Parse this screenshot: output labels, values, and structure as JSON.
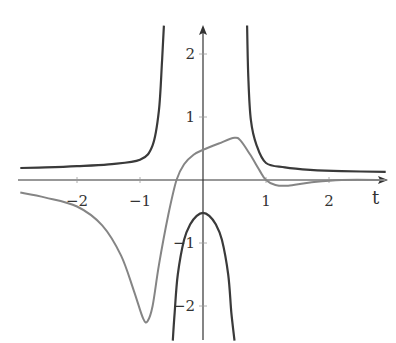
{
  "chart_data": {
    "type": "line",
    "title": "",
    "xlabel": "t",
    "ylabel": "",
    "xlim": [
      -2.9,
      2.9
    ],
    "ylim": [
      -2.55,
      2.45
    ],
    "grid": false,
    "legend": null,
    "x_ticks": [
      -2,
      -1,
      1,
      2
    ],
    "x_tick_labels": [
      "−2",
      "−1",
      "1",
      "2"
    ],
    "y_ticks": [
      2,
      1,
      -1,
      -2
    ],
    "y_tick_labels": [
      "2",
      "1",
      "−1",
      "−2"
    ],
    "colors": {
      "axis": "#333333",
      "dark_curve": "#3a3a3a",
      "gray_curve": "#858585"
    },
    "series": [
      {
        "name": "dark curve (branches with vertical asymptotes near t = ±0.55)",
        "color": "#3a3a3a",
        "segments": [
          {
            "x": [
              -2.9,
              -2.5,
              -2.0,
              -1.5,
              -1.0,
              -0.8,
              -0.7,
              -0.65,
              -0.62
            ],
            "y": [
              0.19,
              0.2,
              0.22,
              0.25,
              0.32,
              0.55,
              1.1,
              1.9,
              2.45
            ]
          },
          {
            "x": [
              -0.48,
              -0.45,
              -0.4,
              -0.3,
              -0.2,
              -0.1,
              0,
              0.1,
              0.2,
              0.3,
              0.4,
              0.45,
              0.5
            ],
            "y": [
              -2.55,
              -2.1,
              -1.5,
              -0.95,
              -0.7,
              -0.57,
              -0.52,
              -0.57,
              -0.7,
              -0.95,
              -1.5,
              -2.1,
              -2.55
            ]
          },
          {
            "x": [
              0.7,
              0.72,
              0.76,
              0.85,
              1.0,
              1.3,
              1.7,
              2.2,
              2.9
            ],
            "y": [
              2.45,
              1.6,
              0.95,
              0.55,
              0.27,
              0.2,
              0.16,
              0.14,
              0.13
            ]
          }
        ]
      },
      {
        "name": "gray curve",
        "color": "#858585",
        "x": [
          -2.9,
          -2.5,
          -2.0,
          -1.6,
          -1.3,
          -1.1,
          -0.95,
          -0.88,
          -0.8,
          -0.7,
          -0.55,
          -0.42,
          -0.3,
          -0.15,
          0,
          0.25,
          0.5,
          0.6,
          0.75,
          0.9,
          1.0,
          1.15,
          1.35,
          1.7,
          2.2,
          2.9
        ],
        "y": [
          -0.2,
          -0.28,
          -0.42,
          -0.72,
          -1.2,
          -1.75,
          -2.2,
          -2.24,
          -2.0,
          -1.35,
          -0.55,
          0.0,
          0.25,
          0.4,
          0.48,
          0.58,
          0.67,
          0.62,
          0.4,
          0.15,
          0.0,
          -0.08,
          -0.09,
          -0.04,
          0.0,
          0.0
        ]
      }
    ]
  }
}
